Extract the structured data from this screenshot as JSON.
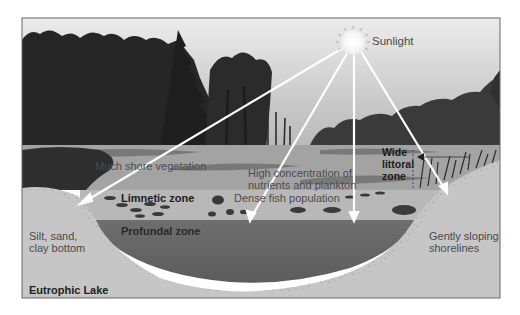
{
  "diagram": {
    "title": "Eutrophic Lake",
    "source_label": "Sunlight",
    "labels": {
      "shore_vegetation": "Much shore vegetation",
      "nutrients_line1": "High concentration of",
      "nutrients_line2": "nutrients and plankton",
      "wide_littoral_line1": "Wide",
      "wide_littoral_line2": "littoral",
      "wide_littoral_line3": "zone",
      "limnetic": "Limnetic zone",
      "fish": "Dense fish population",
      "profundal": "Profundal zone",
      "left_bottom_line1": "Silt, sand,",
      "left_bottom_line2": "clay bottom",
      "right_shore_line1": "Gently sloping",
      "right_shore_line2": "shorelines"
    },
    "sunlight_rays": [
      {
        "to": "left littoral shore",
        "end": [
          80,
          203
        ]
      },
      {
        "to": "limnetic zone",
        "end": [
          250,
          220
        ]
      },
      {
        "to": "profundal boundary",
        "end": [
          355,
          220
        ]
      },
      {
        "to": "right littoral shore",
        "end": [
          447,
          192
        ]
      }
    ],
    "colors": {
      "sky": "#d9d9d9",
      "forest": "#2a2a2a",
      "surface_water": "#9a9a9a",
      "limnetic_band": "#b4b4b4",
      "profundal": "#6b6b6b",
      "sediment": "#c4c4c4",
      "ray": "#ffffff",
      "frame": "#666666"
    }
  }
}
